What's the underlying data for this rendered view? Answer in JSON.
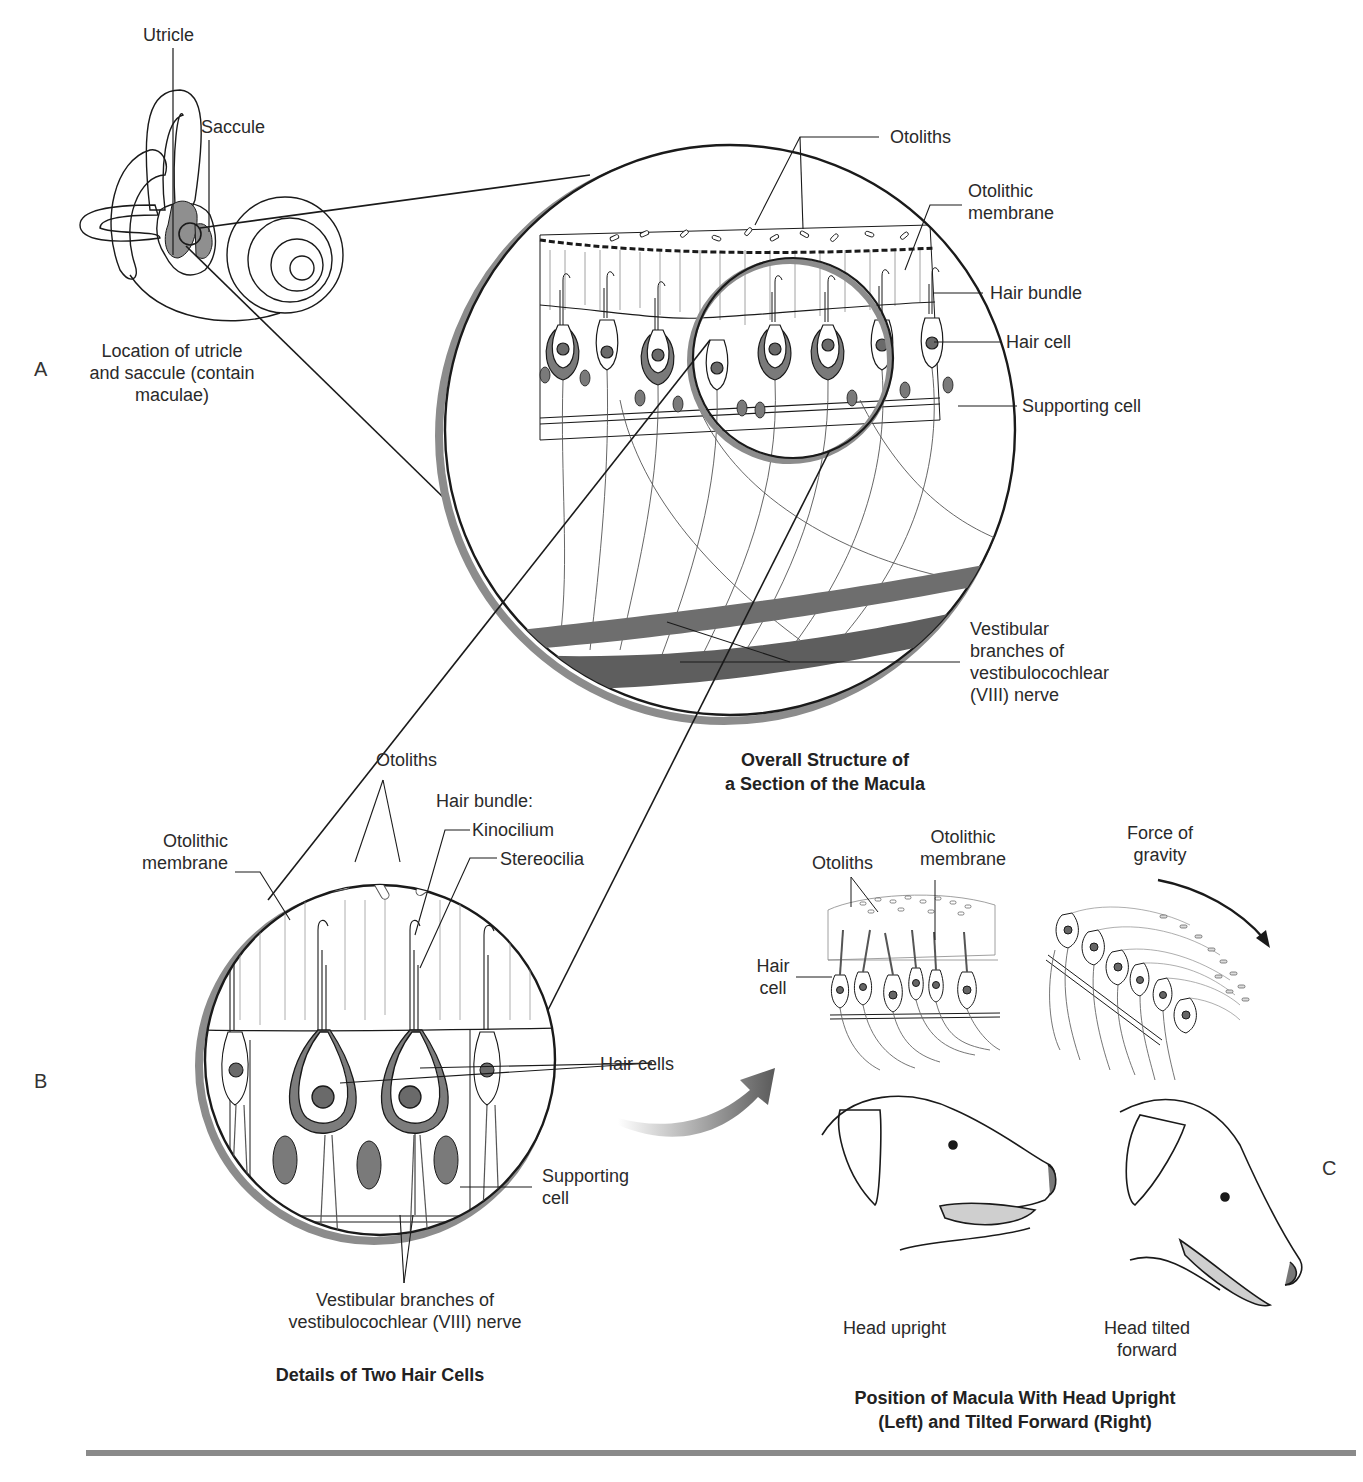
{
  "figure": {
    "panels": {
      "A": "A",
      "B": "B",
      "C": "C"
    },
    "panel_a": {
      "labels": {
        "utricle": "Utricle",
        "saccule": "Saccule",
        "caption_line1": "Location of utricle",
        "caption_line2": "and saccule (contain",
        "caption_line3": "maculae)"
      }
    },
    "overall_structure": {
      "labels": {
        "otoliths": "Otoliths",
        "otolithic_membrane_1": "Otolithic",
        "otolithic_membrane_2": "membrane",
        "hair_bundle": "Hair bundle",
        "hair_cell": "Hair cell",
        "supporting_cell": "Supporting cell",
        "nerve_1": "Vestibular",
        "nerve_2": "branches of",
        "nerve_3": "vestibulocochlear",
        "nerve_4": "(VIII) nerve"
      },
      "title_line1": "Overall Structure of",
      "title_line2": "a Section of the Macula"
    },
    "panel_b": {
      "labels": {
        "otoliths": "Otoliths",
        "hair_bundle": "Hair bundle:",
        "kinocilium": "Kinocilium",
        "stereocilia": "Stereocilia",
        "otolithic_membrane_1": "Otolithic",
        "otolithic_membrane_2": "membrane",
        "hair_cells": "Hair cells",
        "supporting_cell_1": "Supporting",
        "supporting_cell_2": "cell",
        "nerve_1": "Vestibular branches of",
        "nerve_2": "vestibulocochlear (VIII) nerve"
      },
      "title": "Details of Two Hair Cells"
    },
    "panel_c": {
      "labels": {
        "otoliths": "Otoliths",
        "otolithic_membrane_1": "Otolithic",
        "otolithic_membrane_2": "membrane",
        "force_1": "Force of",
        "force_2": "gravity",
        "hair_cell_1": "Hair",
        "hair_cell_2": "cell",
        "head_upright": "Head upright",
        "head_tilted_1": "Head tilted",
        "head_tilted_2": "forward"
      },
      "title_line1": "Position of Macula With Head Upright",
      "title_line2": "(Left) and Tilted Forward (Right)"
    },
    "colors": {
      "line": "#1a1a1a",
      "fill_dark": "#6e6e6e",
      "fill_mid": "#9a9a9a",
      "fill_light": "#c8c8c8",
      "rule": "#8a8a8a"
    }
  }
}
